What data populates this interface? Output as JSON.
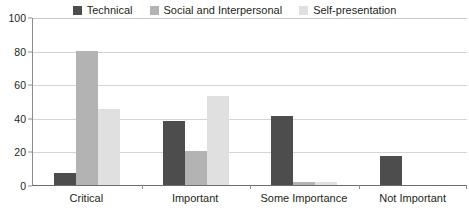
{
  "chart_data": {
    "type": "bar",
    "title": "",
    "subtitle": "",
    "xlabel": "",
    "ylabel": "",
    "categories": [
      "Critical",
      "Important",
      "Some Importance",
      "Not Important"
    ],
    "series": [
      {
        "name": "Technical",
        "color": "#4d4d4d",
        "values": [
          7,
          38,
          41,
          17
        ]
      },
      {
        "name": "Social and Interpersonal",
        "color": "#b3b3b3",
        "values": [
          80,
          20,
          2,
          0
        ]
      },
      {
        "name": "Self-presentation",
        "color": "#e0e0e0",
        "values": [
          45,
          53,
          2,
          0
        ]
      }
    ],
    "ylim": [
      0,
      100
    ],
    "y_ticks": [
      0,
      20,
      40,
      60,
      80,
      100
    ],
    "y_tick_labels": [
      "0",
      "20",
      "40",
      "60",
      "80",
      "100"
    ],
    "grid": true,
    "legend_position": "top-center",
    "annotations": []
  },
  "legend": {
    "items": [
      {
        "label": "Technical",
        "color": "#4d4d4d"
      },
      {
        "label": "Social and Interpersonal",
        "color": "#b3b3b3"
      },
      {
        "label": "Self-presentation",
        "color": "#e0e0e0"
      }
    ]
  },
  "axes": {
    "y": {
      "labels": [
        "100",
        "80",
        "60",
        "40",
        "20",
        "0"
      ]
    },
    "x": {
      "labels": [
        "Critical",
        "Important",
        "Some Importance",
        "Not Important"
      ]
    }
  },
  "colors": {
    "technical": "#4d4d4d",
    "social": "#b3b3b3",
    "self_presentation": "#e0e0e0",
    "gridline": "#d4d4d4",
    "axis": "#8c8c8c",
    "text": "#231f20"
  }
}
